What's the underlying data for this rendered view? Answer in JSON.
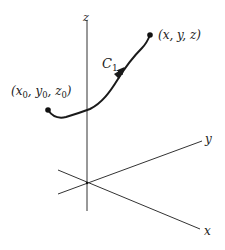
{
  "figure": {
    "width": 225,
    "height": 250,
    "background": "#ffffff",
    "stroke_color": "#333333",
    "curve_color": "#1a1a1a"
  },
  "axes": {
    "origin": [
      87,
      183
    ],
    "z": {
      "label": "z",
      "top": [
        87,
        20
      ],
      "bottom": [
        87,
        211
      ]
    },
    "y": {
      "label": "y",
      "from": [
        58,
        194
      ],
      "to": [
        202,
        141
      ]
    },
    "x": {
      "label": "x",
      "from": [
        58,
        170
      ],
      "to": [
        200,
        229
      ]
    }
  },
  "curve": {
    "label": "C",
    "label_sub": "1",
    "start": {
      "point": [
        48,
        110
      ],
      "label": "(x",
      "sub0": "0",
      "y": ", y",
      "sub1": "0",
      "z": ", z",
      "sub2": "0",
      "close": ")"
    },
    "end": {
      "point": [
        150,
        35
      ],
      "label": "(x, y, z)"
    },
    "direction": "start-to-end"
  }
}
